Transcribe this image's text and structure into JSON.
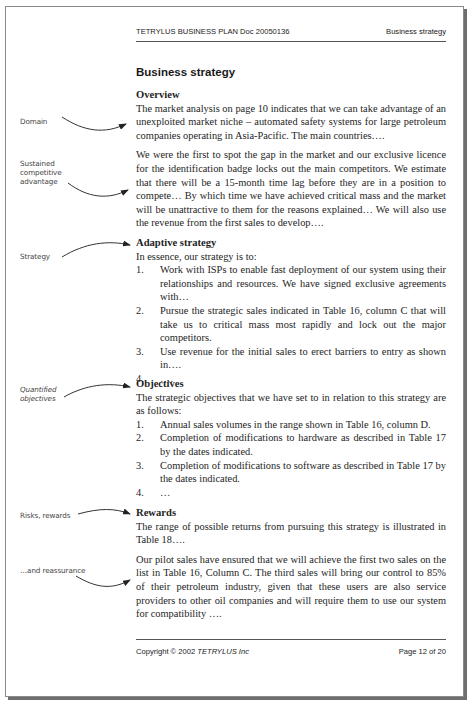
{
  "header": {
    "doc_title": "TETRYLUS BUSINESS PLAN Doc 20050136",
    "section": "Business strategy"
  },
  "page_title": "Business strategy",
  "sections": {
    "overview": {
      "heading": "Overview",
      "paragraphs": [
        "The market analysis on page 10 indicates that we can take advantage of an unexploited market niche – automated safety systems for large petroleum companies operating in Asia-Pacific. The main countries….",
        "We were the first to spot the gap in the market and our exclusive licence for the identification badge locks out the main competitors. We estimate that there will be a 15-month time lag before they are in a position to compete… By which time we have achieved critical mass and the market will be unattractive to them for the reasons explained… We will also use the revenue from the first sales to develop…."
      ]
    },
    "adaptive_strategy": {
      "heading": "Adaptive strategy",
      "intro": "In essence, our strategy is to:",
      "items": [
        {
          "num": "1.",
          "text": "Work with ISPs to enable fast deployment of our system using their relationships and resources. We have signed exclusive agreements with…"
        },
        {
          "num": "2.",
          "text": "Pursue the strategic sales indicated in Table 16, column C that will take us to critical mass most rapidly and lock out the major competitors."
        },
        {
          "num": "3.",
          "text": "Use revenue for the initial sales to erect barriers to entry as shown in…."
        },
        {
          "num": "4.",
          "text": "…."
        }
      ]
    },
    "objectives": {
      "heading": "Objectives",
      "intro": "The strategic objectives that we have set to in relation to this strategy are as follows:",
      "items": [
        {
          "num": "1.",
          "text": "Annual sales volumes in the range shown in Table 16, column D."
        },
        {
          "num": "2.",
          "text": "Completion of modifications to hardware as described in Table 17 by the dates indicated."
        },
        {
          "num": "3.",
          "text": "Completion of modifications to software as described in Table 17 by the dates indicated."
        },
        {
          "num": "4.",
          "text": "…"
        }
      ]
    },
    "rewards": {
      "heading": "Rewards",
      "paragraphs": [
        "The range of possible returns from pursuing this strategy is illustrated in Table 18….",
        "Our pilot sales have ensured that we will achieve the first two sales on the list in Table 16, Column C. The third sales will bring our control to 85% of their petroleum industry, given that these users are also service providers to other oil companies and will require them to use our system for compatibility …."
      ]
    }
  },
  "annotations": {
    "domain": "Domain",
    "advantage": [
      "Sustained",
      "competitive",
      "advantage"
    ],
    "strategy": "Strategy",
    "objectives": [
      "Quantified",
      "objectives"
    ],
    "risks": "Risks, rewards",
    "reassurance": "…and reassurance"
  },
  "footer": {
    "copyright_prefix": "Copyright © 2002 ",
    "company": "TETRYLUS Inc",
    "page": "Page 12 of 20"
  }
}
